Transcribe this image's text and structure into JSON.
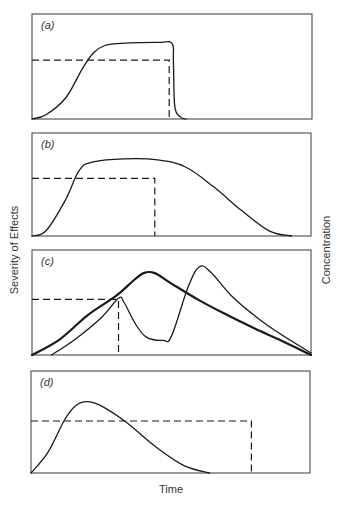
{
  "chart_data": {
    "type": "line",
    "title": "",
    "xlabel": "Time",
    "ylabel_left": "Severity of Effects",
    "ylabel_right": "Concentration",
    "grid": false,
    "legend": null,
    "units": "normalized: x = fraction of time axis (0-1), y = fraction of panel height (0 = baseline, 1 = top)",
    "panels": [
      {
        "label": "(a)",
        "box": [
          32,
          14,
          312,
          119
        ],
        "concentration": {
          "level": 0.56,
          "end_x": 0.49
        },
        "series": [
          {
            "name": "Severity of Effects",
            "style": "thin",
            "points": [
              [
                0,
                0
              ],
              [
                0.05,
                0.04
              ],
              [
                0.12,
                0.2
              ],
              [
                0.18,
                0.48
              ],
              [
                0.22,
                0.63
              ],
              [
                0.26,
                0.7
              ],
              [
                0.32,
                0.72
              ],
              [
                0.45,
                0.73
              ],
              [
                0.5,
                0.72
              ],
              [
                0.505,
                0.55
              ],
              [
                0.51,
                0.12
              ],
              [
                0.53,
                0.02
              ],
              [
                0.55,
                0
              ]
            ]
          }
        ]
      },
      {
        "label": "(b)",
        "box": [
          32,
          133,
          311,
          236
        ],
        "concentration": {
          "level": 0.56,
          "end_x": 0.44
        },
        "series": [
          {
            "name": "Severity of Effects",
            "style": "thin",
            "points": [
              [
                0,
                0
              ],
              [
                0.05,
                0.05
              ],
              [
                0.12,
                0.35
              ],
              [
                0.17,
                0.64
              ],
              [
                0.22,
                0.72
              ],
              [
                0.33,
                0.75
              ],
              [
                0.45,
                0.74
              ],
              [
                0.55,
                0.67
              ],
              [
                0.65,
                0.48
              ],
              [
                0.75,
                0.25
              ],
              [
                0.85,
                0.05
              ],
              [
                0.93,
                0
              ]
            ]
          }
        ]
      },
      {
        "label": "(c)",
        "box": [
          32,
          250,
          311,
          355
        ],
        "concentration": {
          "level": 0.53,
          "end_x": 0.31
        },
        "series": [
          {
            "name": "Severity of Effects (single exposure)",
            "style": "thick",
            "points": [
              [
                0,
                0
              ],
              [
                0.1,
                0.15
              ],
              [
                0.2,
                0.38
              ],
              [
                0.3,
                0.56
              ],
              [
                0.36,
                0.7
              ],
              [
                0.4,
                0.78
              ],
              [
                0.44,
                0.78
              ],
              [
                0.5,
                0.68
              ],
              [
                0.6,
                0.52
              ],
              [
                0.7,
                0.38
              ],
              [
                0.8,
                0.25
              ],
              [
                0.9,
                0.13
              ],
              [
                1.0,
                0
              ]
            ]
          },
          {
            "name": "Severity of Effects (repeated exposure)",
            "style": "thin",
            "points": [
              [
                0.07,
                0
              ],
              [
                0.15,
                0.14
              ],
              [
                0.25,
                0.36
              ],
              [
                0.31,
                0.54
              ],
              [
                0.33,
                0.5
              ],
              [
                0.37,
                0.3
              ],
              [
                0.41,
                0.17
              ],
              [
                0.47,
                0.14
              ],
              [
                0.5,
                0.18
              ],
              [
                0.56,
                0.65
              ],
              [
                0.6,
                0.84
              ],
              [
                0.64,
                0.79
              ],
              [
                0.72,
                0.55
              ],
              [
                0.82,
                0.33
              ],
              [
                0.92,
                0.15
              ],
              [
                1.0,
                0.02
              ]
            ]
          }
        ]
      },
      {
        "label": "(d)",
        "box": [
          31,
          371,
          310,
          473
        ],
        "concentration": {
          "level": 0.51,
          "end_x": 0.79
        },
        "series": [
          {
            "name": "Severity of Effects",
            "style": "thin",
            "points": [
              [
                0,
                0
              ],
              [
                0.06,
                0.2
              ],
              [
                0.12,
                0.52
              ],
              [
                0.16,
                0.66
              ],
              [
                0.2,
                0.7
              ],
              [
                0.25,
                0.66
              ],
              [
                0.34,
                0.5
              ],
              [
                0.45,
                0.25
              ],
              [
                0.55,
                0.07
              ],
              [
                0.64,
                0
              ]
            ]
          }
        ]
      }
    ]
  }
}
